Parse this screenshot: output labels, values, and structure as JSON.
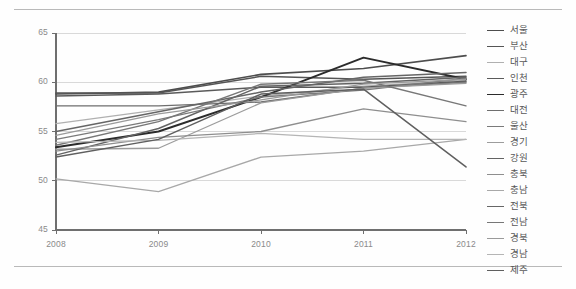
{
  "chart_data": {
    "type": "line",
    "title": "",
    "xlabel": "",
    "ylabel": "",
    "x": [
      "2008",
      "2009",
      "2010",
      "2011",
      "2012"
    ],
    "xlim": [
      "2008",
      "2012"
    ],
    "ylim": [
      45,
      65
    ],
    "yticks": [
      45,
      50,
      55,
      60,
      65
    ],
    "grid": true,
    "legend_position": "right",
    "series": [
      {
        "name": "서울",
        "color": "#4d4d4d",
        "width": 1.6,
        "values": [
          58.8,
          59.0,
          60.8,
          61.4,
          62.7
        ]
      },
      {
        "name": "부산",
        "color": "#555555",
        "width": 1.5,
        "values": [
          58.9,
          58.9,
          60.6,
          60.3,
          60.6
        ]
      },
      {
        "name": "대구",
        "color": "#b0b0b0",
        "width": 1.3,
        "values": [
          55.8,
          57.2,
          58.6,
          59.6,
          60.2
        ]
      },
      {
        "name": "인천",
        "color": "#5a5a5a",
        "width": 1.5,
        "values": [
          58.6,
          58.8,
          59.5,
          59.5,
          60.1
        ]
      },
      {
        "name": "광주",
        "color": "#2b2b2b",
        "width": 1.9,
        "values": [
          53.4,
          55.0,
          58.5,
          62.5,
          60.3
        ]
      },
      {
        "name": "대전",
        "color": "#6e6e6e",
        "width": 1.4,
        "values": [
          57.6,
          57.6,
          58.0,
          59.4,
          60.0
        ]
      },
      {
        "name": "울산",
        "color": "#7a7a7a",
        "width": 1.4,
        "values": [
          54.2,
          56.2,
          58.5,
          59.2,
          60.4
        ]
      },
      {
        "name": "경기",
        "color": "#9c9c9c",
        "width": 1.3,
        "values": [
          53.2,
          53.3,
          57.9,
          59.4,
          59.9
        ]
      },
      {
        "name": "강원",
        "color": "#636363",
        "width": 1.5,
        "values": [
          52.6,
          55.3,
          59.6,
          59.9,
          60.5
        ]
      },
      {
        "name": "충북",
        "color": "#8e8e8e",
        "width": 1.3,
        "values": [
          53.0,
          54.4,
          55.0,
          57.3,
          56.0
        ]
      },
      {
        "name": "충남",
        "color": "#a8a8a8",
        "width": 1.3,
        "values": [
          50.2,
          48.9,
          52.4,
          53.0,
          54.2
        ]
      },
      {
        "name": "전북",
        "color": "#666666",
        "width": 1.5,
        "values": [
          55.0,
          57.0,
          59.0,
          60.5,
          61.0
        ]
      },
      {
        "name": "전남",
        "color": "#777777",
        "width": 1.4,
        "values": [
          53.6,
          56.0,
          59.8,
          60.2,
          57.6
        ]
      },
      {
        "name": "경북",
        "color": "#9a9a9a",
        "width": 1.3,
        "values": [
          54.6,
          56.8,
          58.2,
          59.8,
          60.3
        ]
      },
      {
        "name": "경남",
        "color": "#b5b5b5",
        "width": 1.3,
        "values": [
          53.9,
          54.1,
          54.8,
          54.2,
          54.2
        ]
      },
      {
        "name": "제주",
        "color": "#5f5f5f",
        "width": 1.5,
        "values": [
          52.4,
          54.2,
          58.8,
          59.3,
          51.4
        ]
      }
    ]
  },
  "axis": {
    "ytick_labels": [
      "65",
      "60",
      "55",
      "50",
      "45"
    ],
    "xtick_labels": [
      "2008",
      "2009",
      "2010",
      "2011",
      "2012"
    ]
  },
  "colors": {
    "grid": "#d9d9d9",
    "axis": "#6f6f6f",
    "tick_text": "#8a8a8a",
    "legend_text": "#585858",
    "frame_rule": "#b9b9b9",
    "background": "#fefefe"
  }
}
